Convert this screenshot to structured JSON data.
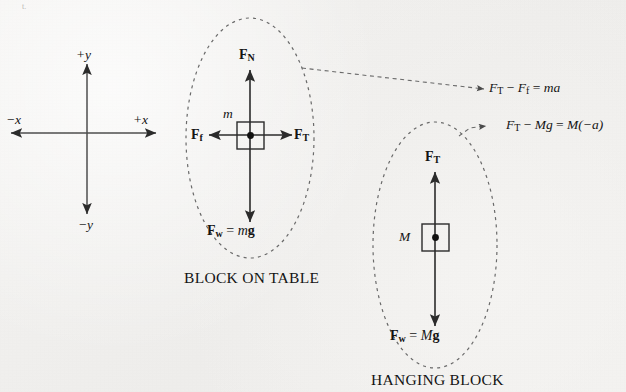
{
  "figure": {
    "background_color": "#f2f1ef",
    "ink_color": "#2b2b2b",
    "corner_mark": "t."
  },
  "axes": {
    "name": "coordinate-axes",
    "center": {
      "x": 87,
      "y": 133
    },
    "labels": {
      "plus_y": "+y",
      "minus_y": "−y",
      "plus_x": "+x",
      "minus_x": "−x"
    }
  },
  "diagrams": [
    {
      "id": "block-on-table",
      "caption": "BLOCK ON TABLE",
      "mass_label": "m",
      "forces": [
        {
          "name": "normal",
          "symbol": "F",
          "subscript": "N",
          "direction": "up"
        },
        {
          "name": "tension",
          "symbol": "F",
          "subscript": "T",
          "direction": "right"
        },
        {
          "name": "friction",
          "symbol": "F",
          "subscript": "f",
          "direction": "left"
        },
        {
          "name": "weight",
          "symbol": "F",
          "subscript": "w",
          "direction": "down"
        }
      ],
      "weight_equation": {
        "lhs_symbol": "F",
        "lhs_sub": "w",
        "equals": "=",
        "rhs_mass": "m",
        "rhs_g": "g"
      }
    },
    {
      "id": "hanging-block",
      "caption": "HANGING BLOCK",
      "mass_label": "M",
      "forces": [
        {
          "name": "tension",
          "symbol": "F",
          "subscript": "T",
          "direction": "up"
        },
        {
          "name": "weight",
          "symbol": "F",
          "subscript": "w",
          "direction": "down"
        }
      ],
      "weight_equation": {
        "lhs_symbol": "F",
        "lhs_sub": "w",
        "equals": "=",
        "rhs_mass": "M",
        "rhs_g": "g"
      }
    }
  ],
  "equations": [
    {
      "id": "equation-block-on-table",
      "text": "F_T − F_f = ma",
      "parts": {
        "f1": "F",
        "s1": "T",
        "minus": "−",
        "f2": "F",
        "s2": "f",
        "eq": "=",
        "rhs": "ma"
      }
    },
    {
      "id": "equation-hanging-block",
      "text": "F_T − Mg = M(−a)",
      "parts": {
        "f1": "F",
        "s1": "T",
        "minus": "−",
        "mg": "Mg",
        "eq": "=",
        "rhs": "M(−a)"
      }
    }
  ]
}
